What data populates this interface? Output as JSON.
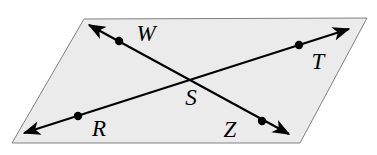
{
  "figure": {
    "type": "geometry-diagram",
    "background_color": "#ffffff"
  },
  "plane": {
    "name": "plane",
    "shape": "parallelogram",
    "fill_color": "#ebebeb",
    "stroke_color": "#808080",
    "stroke_width": 1,
    "corners": [
      {
        "x": 84,
        "y": 19
      },
      {
        "x": 367,
        "y": 18
      },
      {
        "x": 300,
        "y": 143
      },
      {
        "x": 12,
        "y": 143
      }
    ],
    "points_polygon": "84,19 367,18 300,143 12,143"
  },
  "lines": [
    {
      "id": "line-RT",
      "label": "RT",
      "description": "line through R, S and T, double-headed",
      "stroke_color": "#000000",
      "stroke_width": 2.2,
      "x1": 24,
      "y1": 133,
      "x2": 349,
      "y2": 29,
      "arrow_start": true,
      "arrow_end": true
    },
    {
      "id": "line-WZ",
      "label": "WZ",
      "description": "line through W, S and Z, double-headed",
      "stroke_color": "#000000",
      "stroke_width": 2.2,
      "x1": 89,
      "y1": 25,
      "x2": 289,
      "y2": 134,
      "arrow_start": true,
      "arrow_end": true
    }
  ],
  "points": [
    {
      "id": "point-W",
      "label": "W",
      "dot": {
        "x": 119,
        "y": 41,
        "r": 4.2
      },
      "label_pos": {
        "x": 146,
        "y": 41
      },
      "font_size": 23,
      "has_dot": true
    },
    {
      "id": "point-T",
      "label": "T",
      "dot": {
        "x": 299,
        "y": 45,
        "r": 4.2
      },
      "label_pos": {
        "x": 318,
        "y": 69
      },
      "font_size": 23,
      "has_dot": true
    },
    {
      "id": "point-S",
      "label": "S",
      "dot": {
        "x": 187,
        "y": 83,
        "r": 0
      },
      "label_pos": {
        "x": 191,
        "y": 105
      },
      "font_size": 23,
      "has_dot": false
    },
    {
      "id": "point-R",
      "label": "R",
      "dot": {
        "x": 78,
        "y": 116,
        "r": 4.2
      },
      "label_pos": {
        "x": 99,
        "y": 136
      },
      "font_size": 23,
      "has_dot": true
    },
    {
      "id": "point-Z",
      "label": "Z",
      "dot": {
        "x": 262,
        "y": 121,
        "r": 4.2
      },
      "label_pos": {
        "x": 230,
        "y": 137
      },
      "font_size": 23,
      "has_dot": true
    }
  ],
  "colors": {
    "line": "#000000",
    "plane_fill": "#ebebeb",
    "plane_edge": "#808080",
    "label": "#000000"
  }
}
